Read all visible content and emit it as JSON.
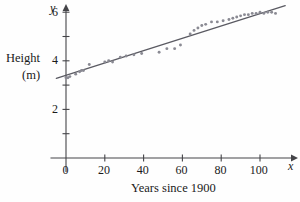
{
  "chart_data": {
    "type": "scatter",
    "title": "",
    "xlabel": "Years since 1900",
    "ylabel": "Height (m)",
    "xlim": [
      -8,
      116
    ],
    "ylim": [
      0,
      6.7
    ],
    "grid": false,
    "legend": null,
    "x_ticks": [
      0,
      20,
      40,
      60,
      80,
      100
    ],
    "x_tick_labels": [
      "0",
      "20",
      "40",
      "60",
      "80",
      "100"
    ],
    "x_minor_ticks": [],
    "y_ticks": [
      2,
      4,
      6
    ],
    "y_tick_labels": [
      "2",
      "4",
      "6"
    ],
    "y_minor_ticks": [
      1,
      3,
      5
    ],
    "x_axis_letter": "x",
    "y_axis_letter": "y",
    "point_color": "#8a8a93",
    "line_color": "#5a5a62",
    "axis_color": "#444448",
    "series": [
      {
        "name": "records",
        "x": [
          0,
          1,
          2,
          5,
          7,
          8,
          9,
          12,
          20,
          22,
          24,
          28,
          31,
          35,
          39,
          48,
          52,
          56,
          59,
          64,
          66,
          68,
          70,
          72,
          75,
          78,
          81,
          84,
          86,
          88,
          90,
          92,
          94,
          96,
          98,
          100,
          102,
          104,
          106,
          108
        ],
        "y": [
          3.3,
          3.3,
          3.35,
          3.45,
          3.55,
          3.6,
          3.6,
          3.85,
          3.95,
          4.0,
          3.95,
          4.15,
          4.2,
          4.25,
          4.3,
          4.35,
          4.5,
          4.5,
          4.65,
          5.1,
          5.25,
          5.35,
          5.45,
          5.5,
          5.6,
          5.6,
          5.65,
          5.7,
          5.75,
          5.8,
          5.85,
          5.9,
          5.9,
          5.95,
          5.95,
          6.0,
          5.95,
          6.0,
          6.0,
          5.95
        ]
      }
    ],
    "trend_line": {
      "name": "regression-line",
      "x_start": -5,
      "y_start": 3.28,
      "x_end": 113,
      "y_end": 6.27
    }
  }
}
